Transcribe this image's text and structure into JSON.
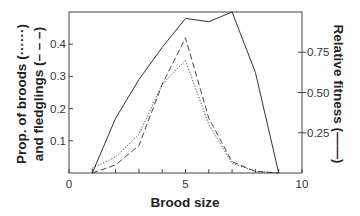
{
  "chart_data": {
    "type": "line",
    "title": "",
    "xlabel": "Brood size",
    "ylabel_left": "Prop. of broods (……) and fledglings (— —)",
    "ylabel_left_lines": [
      "Prop. of broods (······)",
      "and fledglings (– – –)"
    ],
    "ylabel_right": "Relative fitness (——)",
    "xlim": [
      0,
      10
    ],
    "ylim_left": [
      0,
      0.5
    ],
    "ylim_right": [
      0,
      1.0
    ],
    "x_ticks": [
      0,
      1,
      2,
      3,
      4,
      5,
      6,
      7,
      8,
      9,
      10
    ],
    "x_tick_labels": [
      {
        "value": 0,
        "label": "0"
      },
      {
        "value": 5,
        "label": "5"
      },
      {
        "value": 10,
        "label": "10"
      }
    ],
    "y_left_ticks": [
      {
        "value": 0.1,
        "label": "0.1"
      },
      {
        "value": 0.2,
        "label": "0.2"
      },
      {
        "value": 0.3,
        "label": "0.3"
      },
      {
        "value": 0.4,
        "label": "0.4"
      }
    ],
    "y_right_ticks": [
      {
        "value": 0.25,
        "label": "0.25"
      },
      {
        "value": 0.5,
        "label": "0.50"
      },
      {
        "value": 0.75,
        "label": "0.75"
      }
    ],
    "grid": false,
    "legend": "none (line styles indicated in axis labels)",
    "x": [
      1,
      2,
      3,
      4,
      5,
      6,
      7,
      8,
      9
    ],
    "series": [
      {
        "name": "Proportion of broods",
        "axis": "left",
        "style": "dotted",
        "values": [
          0.015,
          0.05,
          0.12,
          0.275,
          0.35,
          0.15,
          0.03,
          0.005,
          0.0
        ]
      },
      {
        "name": "Proportion of fledglings",
        "axis": "left",
        "style": "dashed",
        "values": [
          0.0,
          0.025,
          0.085,
          0.275,
          0.42,
          0.17,
          0.035,
          0.005,
          0.0
        ]
      },
      {
        "name": "Relative fitness",
        "axis": "right",
        "style": "solid",
        "values": [
          0.0,
          0.34,
          0.58,
          0.78,
          0.96,
          0.94,
          1.0,
          0.625,
          0.0
        ]
      }
    ]
  }
}
